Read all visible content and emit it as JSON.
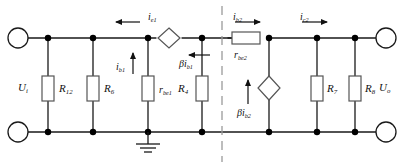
{
  "diagram": {
    "colors": {
      "wire": "#1a1a1a",
      "node": "#000000",
      "component_fill": "#ffffff",
      "component_stroke": "#555555",
      "divider": "#9a9a9a",
      "text": "#111111"
    },
    "divider": {
      "name": "stage-divider",
      "style": "dashed-vertical"
    }
  },
  "ports": {
    "input_top": "",
    "input_bottom": "",
    "output_top": "",
    "output_bottom": "",
    "input_voltage": {
      "sym": "U",
      "sub": "i"
    },
    "output_voltage": {
      "sym": "U",
      "sub": "o"
    }
  },
  "resistors": [
    {
      "id": "R12",
      "sym": "R",
      "sub": "12",
      "orientation": "vertical",
      "stage": "input"
    },
    {
      "id": "R6",
      "sym": "R",
      "sub": "6",
      "orientation": "vertical",
      "stage": "input"
    },
    {
      "id": "rbe1",
      "sym": "r",
      "sub": "be1",
      "orientation": "vertical",
      "stage": "input"
    },
    {
      "id": "R4",
      "sym": "R",
      "sub": "4",
      "orientation": "vertical",
      "stage": "input"
    },
    {
      "id": "rbe2",
      "sym": "r",
      "sub": "be2",
      "orientation": "horizontal",
      "stage": "output"
    },
    {
      "id": "R7",
      "sym": "R",
      "sub": "7",
      "orientation": "vertical",
      "stage": "output"
    },
    {
      "id": "R8",
      "sym": "R",
      "sub": "8",
      "orientation": "vertical",
      "stage": "output"
    }
  ],
  "sources": [
    {
      "id": "beta-ib1",
      "type": "dependent-current-source",
      "sym": "βi",
      "sub": "b1",
      "arrow": "left",
      "stage": "input"
    },
    {
      "id": "beta-ib2",
      "type": "dependent-current-source",
      "sym": "βi",
      "sub": "b2",
      "arrow": "up",
      "stage": "output"
    }
  ],
  "currents": [
    {
      "id": "ie1",
      "sym": "i",
      "sub": "e1",
      "arrow": "left",
      "stage": "input"
    },
    {
      "id": "ib1",
      "sym": "i",
      "sub": "b1",
      "arrow": "up",
      "stage": "input"
    },
    {
      "id": "ib2",
      "sym": "i",
      "sub": "b2",
      "arrow": "right",
      "stage": "output"
    },
    {
      "id": "ic2",
      "sym": "i",
      "sub": "c2",
      "arrow": "right",
      "stage": "output"
    }
  ],
  "ground": {
    "name": "ground-symbol",
    "label": ""
  }
}
